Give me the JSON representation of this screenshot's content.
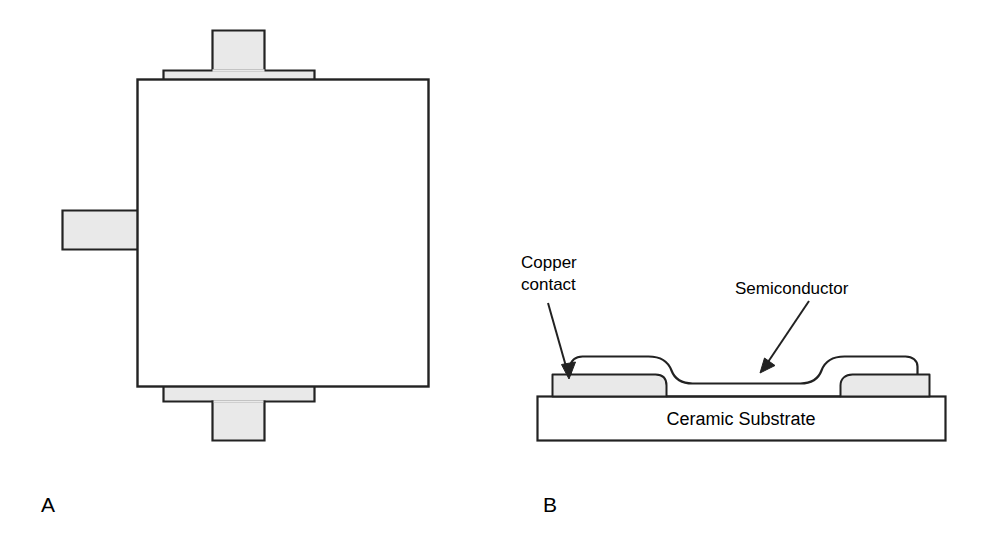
{
  "figure": {
    "panels": [
      {
        "id": "A",
        "letter": "A",
        "view": "plan",
        "description": "Top view of symmetric four-terminal device outline"
      },
      {
        "id": "B",
        "letter": "B",
        "view": "cross-section",
        "description": "Cross-sectional view of thin film device on ceramic substrate"
      }
    ],
    "labels": {
      "copper_contact_line1": "Copper",
      "copper_contact_line2": "contact",
      "semiconductor": "Semiconductor",
      "ceramic_substrate": "Ceramic Substrate"
    },
    "colors": {
      "metal_fill": "#e9e9e9",
      "body_fill": "#ffffff",
      "substrate_fill": "#ffffff",
      "stroke": "#222222",
      "text": "#000000",
      "background": "#ffffff"
    },
    "geometry": {
      "panel_a": {
        "body": {
          "x": 137,
          "y": 79,
          "width": 291,
          "height": 307
        },
        "top_stem": {
          "x": 212,
          "y": 30,
          "width": 53,
          "height": 41
        },
        "top_flange": {
          "x": 163,
          "y": 70,
          "width": 152,
          "height": 10
        },
        "bottom_flange": {
          "x": 163,
          "y": 386,
          "width": 152,
          "height": 16
        },
        "bottom_stem": {
          "x": 212,
          "y": 402,
          "width": 53,
          "height": 39
        },
        "left_tab": {
          "x": 62,
          "y": 210,
          "width": 76,
          "height": 40
        },
        "right_tab": {
          "x": 340,
          "y": 209,
          "width": 88,
          "height": 41
        },
        "letter_position": {
          "x": 41,
          "y": 512
        }
      },
      "panel_b": {
        "substrate": {
          "x": 537,
          "y": 396,
          "width": 408,
          "height": 44
        },
        "left_contact": {
          "x": 552,
          "y": 374,
          "width": 115,
          "height": 22
        },
        "right_contact": {
          "x": 840,
          "y": 374,
          "width": 90,
          "height": 22
        },
        "semiconductor_top": 364,
        "semiconductor_bottom": 383,
        "letter_position": {
          "x": 543,
          "y": 512
        }
      }
    },
    "annotations": [
      {
        "name": "copper-contact-callout",
        "text_lines": [
          "Copper",
          "contact"
        ],
        "text_x": 521,
        "text_y_first": 268,
        "text_y_second": 290,
        "arrow_from": {
          "x": 548,
          "y": 303
        },
        "arrow_to": {
          "x": 569,
          "y": 377
        }
      },
      {
        "name": "semiconductor-callout",
        "text_lines": [
          "Semiconductor"
        ],
        "text_x": 735,
        "text_y_first": 294,
        "arrow_from": {
          "x": 809,
          "y": 301
        },
        "arrow_to": {
          "x": 761,
          "y": 371
        }
      }
    ]
  }
}
